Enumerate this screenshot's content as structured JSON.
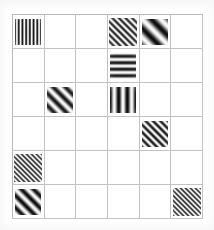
{
  "stimulus": {
    "title": "gabor-patch-grid",
    "description": "6 by 6 grid of oriented Gabor patches on a white background",
    "grid": {
      "rows": 6,
      "cols": 6,
      "line_color": "#c2c2c6",
      "background_color": "#ffffff",
      "patch_color": "#1a1a1a"
    },
    "patches": [
      {
        "id": "patch-r1c1",
        "row": 1,
        "col": 1,
        "orientation_deg": 0,
        "orientation_label": "vertical",
        "spatial_frequency": "high",
        "cycles": 7,
        "size": 26,
        "envelope": "gaussian",
        "contrast": 0.95
      },
      {
        "id": "patch-r1c4",
        "row": 1,
        "col": 4,
        "orientation_deg": 45,
        "orientation_label": "diagonal-right",
        "spatial_frequency": "high",
        "cycles": 6,
        "size": 28,
        "envelope": "gaussian",
        "contrast": 0.9
      },
      {
        "id": "patch-r1c5",
        "row": 1,
        "col": 5,
        "orientation_deg": 45,
        "orientation_label": "diagonal-right",
        "spatial_frequency": "low",
        "cycles": 2,
        "size": 26,
        "envelope": "gaussian",
        "contrast": 1.0
      },
      {
        "id": "patch-r2c4",
        "row": 2,
        "col": 4,
        "orientation_deg": 90,
        "orientation_label": "horizontal",
        "spatial_frequency": "medium",
        "cycles": 4,
        "size": 26,
        "envelope": "gaussian",
        "contrast": 0.95
      },
      {
        "id": "patch-r3c2",
        "row": 3,
        "col": 2,
        "orientation_deg": 45,
        "orientation_label": "diagonal-right",
        "spatial_frequency": "low",
        "cycles": 3,
        "size": 26,
        "envelope": "gaussian",
        "contrast": 0.95
      },
      {
        "id": "patch-r3c4",
        "row": 3,
        "col": 4,
        "orientation_deg": 0,
        "orientation_label": "vertical",
        "spatial_frequency": "low",
        "cycles": 3,
        "size": 26,
        "envelope": "gaussian",
        "contrast": 1.0
      },
      {
        "id": "patch-r4c5",
        "row": 4,
        "col": 5,
        "orientation_deg": 45,
        "orientation_label": "diagonal-right",
        "spatial_frequency": "medium",
        "cycles": 5,
        "size": 26,
        "envelope": "gaussian",
        "contrast": 0.95
      },
      {
        "id": "patch-r5c1",
        "row": 5,
        "col": 1,
        "orientation_deg": 45,
        "orientation_label": "diagonal-right",
        "spatial_frequency": "very-high",
        "cycles": 8,
        "size": 28,
        "envelope": "gaussian",
        "contrast": 0.85
      },
      {
        "id": "patch-r6c1",
        "row": 6,
        "col": 1,
        "orientation_deg": 45,
        "orientation_label": "diagonal-right",
        "spatial_frequency": "low",
        "cycles": 3,
        "size": 26,
        "envelope": "gaussian",
        "contrast": 1.0
      },
      {
        "id": "patch-r6c6",
        "row": 6,
        "col": 6,
        "orientation_deg": 45,
        "orientation_label": "diagonal-right",
        "spatial_frequency": "very-high",
        "cycles": 8,
        "size": 28,
        "envelope": "gaussian",
        "contrast": 0.85
      }
    ],
    "empty_cells_count": 26,
    "patch_count": 10
  }
}
